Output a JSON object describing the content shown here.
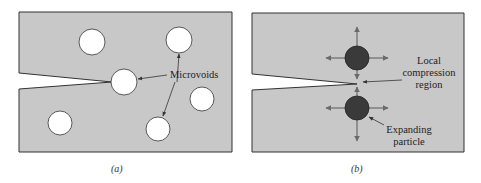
{
  "figure": {
    "panels": [
      {
        "id": "a",
        "caption": "(a)",
        "label": "Microvoids",
        "colors": {
          "material": "#c8c8c8",
          "void": "#ffffff",
          "border": "#333333"
        },
        "voids": [
          {
            "cx": 92,
            "cy": 42,
            "r": 13
          },
          {
            "cx": 179,
            "cy": 40,
            "r": 13
          },
          {
            "cx": 124,
            "cy": 82,
            "r": 13
          },
          {
            "cx": 202,
            "cy": 99,
            "r": 12
          },
          {
            "cx": 60,
            "cy": 123,
            "r": 12
          },
          {
            "cx": 158,
            "cy": 129,
            "r": 12
          }
        ]
      },
      {
        "id": "b",
        "caption": "(b)",
        "labels": {
          "compression_line1": "Local",
          "compression_line2": "compression",
          "compression_line3": "region",
          "particle_line1": "Expanding",
          "particle_line2": "particle"
        },
        "colors": {
          "material": "#c8c8c8",
          "particle": "#3a3a3a",
          "arrow": "#6a6a6a",
          "border": "#333333"
        },
        "particles": [
          {
            "cx": 357,
            "cy": 58,
            "r": 12
          },
          {
            "cx": 357,
            "cy": 108,
            "r": 12
          }
        ]
      }
    ]
  }
}
